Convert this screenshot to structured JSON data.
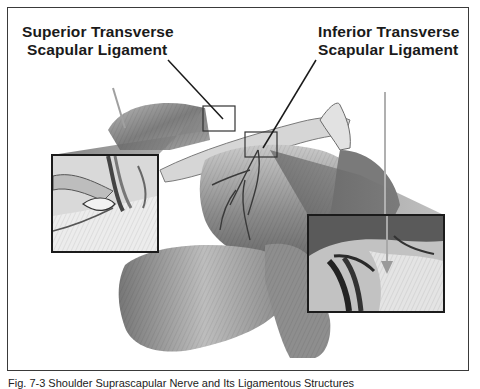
{
  "figure": {
    "labels": {
      "superior": {
        "line1": "Superior Transverse",
        "line2": "Scapular Ligament"
      },
      "inferior": {
        "line1": "Inferior Transverse",
        "line2": "Scapular Ligament"
      }
    },
    "caption": "Fig. 7-3 Shoulder Suprascapular Nerve and Its Ligamentous Structures",
    "insets": [
      {
        "name": "left-inset",
        "description": "magnified view of superior transverse scapular ligament"
      },
      {
        "name": "right-inset",
        "description": "magnified view of inferior transverse scapular ligament"
      }
    ],
    "colors": {
      "frame": "#3a3a3a",
      "label_text": "#1a1a1a",
      "leader_line": "#1a1a1a",
      "arrow": "#9a9a9a",
      "muscle_dark": "#5a5a5a",
      "muscle_mid": "#8c8c8c",
      "muscle_light": "#c8c8c8"
    }
  }
}
